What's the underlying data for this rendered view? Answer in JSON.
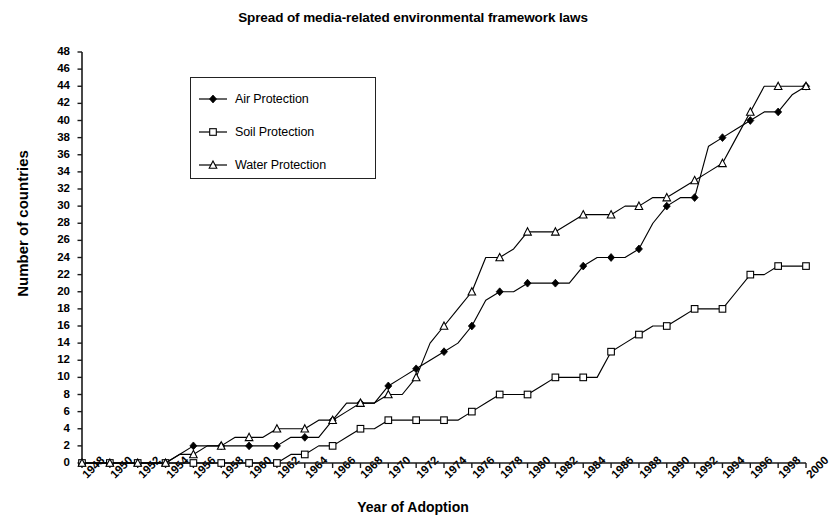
{
  "chart_data": {
    "type": "line",
    "title": "Spread of media-related environmental framework laws",
    "xlabel": "Year of Adoption",
    "ylabel": "Number of countries",
    "grid": false,
    "legend_position": "upper-left-inset",
    "xlim": [
      1948,
      2000
    ],
    "ylim": [
      0,
      48
    ],
    "ytick_step": 2,
    "xtick_step": 2,
    "x": [
      1948,
      1949,
      1950,
      1951,
      1952,
      1953,
      1954,
      1955,
      1956,
      1957,
      1958,
      1959,
      1960,
      1961,
      1962,
      1963,
      1964,
      1965,
      1966,
      1967,
      1968,
      1969,
      1970,
      1971,
      1972,
      1973,
      1974,
      1975,
      1976,
      1977,
      1978,
      1979,
      1980,
      1981,
      1982,
      1983,
      1984,
      1985,
      1986,
      1987,
      1988,
      1989,
      1990,
      1991,
      1992,
      1993,
      1994,
      1995,
      1996,
      1997,
      1998,
      1999,
      2000
    ],
    "xtick_labels": [
      "1948",
      "1950",
      "1952",
      "1954",
      "1956",
      "1958",
      "1960",
      "1962",
      "1964",
      "1966",
      "1968",
      "1970",
      "1972",
      "1974",
      "1976",
      "1978",
      "1980",
      "1982",
      "1984",
      "1986",
      "1988",
      "1990",
      "1992",
      "1994",
      "1996",
      "1998",
      "2000"
    ],
    "ytick_labels": [
      "0",
      "2",
      "4",
      "6",
      "8",
      "10",
      "12",
      "14",
      "16",
      "18",
      "20",
      "22",
      "24",
      "26",
      "28",
      "30",
      "32",
      "34",
      "36",
      "38",
      "40",
      "42",
      "44",
      "46",
      "48"
    ],
    "series": [
      {
        "name": "Air Protection",
        "marker": "filled-diamond",
        "color": "#000000",
        "values": [
          0,
          0,
          0,
          0,
          0,
          0,
          0,
          1,
          2,
          2,
          2,
          2,
          2,
          2,
          2,
          3,
          3,
          3,
          5,
          6,
          7,
          7,
          9,
          10,
          11,
          12,
          13,
          14,
          16,
          19,
          20,
          20,
          21,
          21,
          21,
          21,
          23,
          24,
          24,
          24,
          25,
          28,
          30,
          31,
          31,
          37,
          38,
          39,
          40,
          41,
          41,
          43,
          44
        ]
      },
      {
        "name": "Soil Protection",
        "marker": "open-square",
        "color": "#000000",
        "values": [
          0,
          0,
          0,
          0,
          0,
          0,
          0,
          0,
          0,
          0,
          0,
          0,
          0,
          0,
          0,
          1,
          1,
          2,
          2,
          3,
          4,
          4,
          5,
          5,
          5,
          5,
          5,
          5,
          6,
          7,
          8,
          8,
          8,
          9,
          10,
          10,
          10,
          10,
          13,
          14,
          15,
          16,
          16,
          17,
          18,
          18,
          18,
          20,
          22,
          22,
          23,
          23,
          23
        ]
      },
      {
        "name": "Water Protection",
        "marker": "open-triangle",
        "color": "#000000",
        "values": [
          0,
          0,
          0,
          0,
          0,
          0,
          0,
          1,
          1,
          2,
          2,
          3,
          3,
          3,
          4,
          4,
          4,
          5,
          5,
          7,
          7,
          7,
          8,
          8,
          10,
          14,
          16,
          18,
          20,
          24,
          24,
          25,
          27,
          27,
          27,
          28,
          29,
          29,
          29,
          30,
          30,
          31,
          31,
          32,
          33,
          34,
          35,
          38,
          41,
          44,
          44,
          44,
          44
        ]
      }
    ]
  },
  "legend": {
    "items": [
      {
        "label": "Air Protection",
        "marker": "filled-diamond"
      },
      {
        "label": "Soil Protection",
        "marker": "open-square"
      },
      {
        "label": "Water Protection",
        "marker": "open-triangle"
      }
    ]
  },
  "axes": {
    "axis_color": "#1a1a1a",
    "line_color": "#000000"
  }
}
